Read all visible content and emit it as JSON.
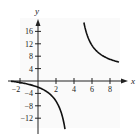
{
  "chart_data": {
    "type": "line",
    "title": "",
    "xlabel": "x",
    "ylabel": "y",
    "xlim": [
      -3,
      9.5
    ],
    "ylim": [
      -14,
      19
    ],
    "x_ticks": [
      -2,
      2,
      4,
      6,
      8
    ],
    "y_ticks": [
      16,
      12,
      8,
      4,
      -4,
      -8,
      -12
    ],
    "x_tick_labels": [
      "−2",
      "2",
      "4",
      "6",
      "8"
    ],
    "y_tick_labels": [
      "16",
      "12",
      "8",
      "4",
      "−4",
      "−8",
      "−12"
    ],
    "grid": false,
    "vertical_asymptote": 4,
    "series": [
      {
        "name": "left branch",
        "x": [
          -3,
          -2,
          -1,
          0,
          1,
          2,
          2.5,
          3
        ],
        "y": [
          -0.1,
          -0.5,
          -1.1,
          -2.0,
          -3.5,
          -6.5,
          -9.5,
          -15.5
        ]
      },
      {
        "name": "right branch",
        "x": [
          5.1,
          5.5,
          6,
          7,
          8,
          9
        ],
        "y": [
          18.9,
          14.5,
          11.5,
          8.5,
          7.0,
          6.1
        ]
      }
    ],
    "line_color": "#111111"
  }
}
